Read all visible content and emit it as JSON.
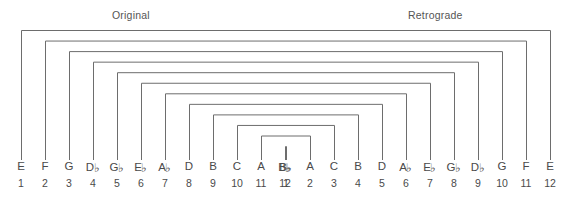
{
  "headers": {
    "original": "Original",
    "retrograde": "Retrograde"
  },
  "colors": {
    "line": "#6d6d6d",
    "text": "#4a4a4a",
    "title": "#555555",
    "background": "#ffffff"
  },
  "chart_data": {
    "type": "diagram",
    "diagram_kind": "nested-bracket-mapping",
    "left_row": {
      "label": "Original",
      "notes": [
        "E",
        "F",
        "G",
        "D♭",
        "G♭",
        "E♭",
        "A♭",
        "D",
        "B",
        "C",
        "A",
        "B♭"
      ],
      "numbers": [
        1,
        2,
        3,
        4,
        5,
        6,
        7,
        8,
        9,
        10,
        11,
        12
      ]
    },
    "right_row": {
      "label": "Retrograde",
      "notes": [
        "B♭",
        "A",
        "C",
        "B",
        "D",
        "A♭",
        "E♭",
        "G♭",
        "D♭",
        "G",
        "F",
        "E"
      ],
      "numbers": [
        1,
        2,
        3,
        4,
        5,
        6,
        7,
        8,
        9,
        10,
        11,
        12
      ]
    },
    "connections": [
      {
        "level": 1,
        "left_index": 1,
        "left_note": "E",
        "right_index": 12,
        "right_note": "E"
      },
      {
        "level": 2,
        "left_index": 2,
        "left_note": "F",
        "right_index": 11,
        "right_note": "F"
      },
      {
        "level": 3,
        "left_index": 3,
        "left_note": "G",
        "right_index": 10,
        "right_note": "G"
      },
      {
        "level": 4,
        "left_index": 4,
        "left_note": "D♭",
        "right_index": 9,
        "right_note": "D♭"
      },
      {
        "level": 5,
        "left_index": 5,
        "left_note": "G♭",
        "right_index": 8,
        "right_note": "G♭"
      },
      {
        "level": 6,
        "left_index": 6,
        "left_note": "E♭",
        "right_index": 7,
        "right_note": "E♭"
      },
      {
        "level": 7,
        "left_index": 7,
        "left_note": "A♭",
        "right_index": 6,
        "right_note": "A♭"
      },
      {
        "level": 8,
        "left_index": 8,
        "left_note": "D",
        "right_index": 5,
        "right_note": "D"
      },
      {
        "level": 9,
        "left_index": 9,
        "left_note": "B",
        "right_index": 4,
        "right_note": "B"
      },
      {
        "level": 10,
        "left_index": 10,
        "left_note": "C",
        "right_index": 3,
        "right_note": "C"
      },
      {
        "level": 11,
        "left_index": 11,
        "left_note": "A",
        "right_index": 2,
        "right_note": "A"
      },
      {
        "level": 12,
        "left_index": 12,
        "left_note": "B♭",
        "right_index": 1,
        "right_note": "B♭"
      }
    ]
  },
  "geometry": {
    "left_start_x": 21,
    "right_start_x": 286,
    "step_x": 24,
    "bracket_top_first": 30,
    "bracket_top_step": 10.55,
    "bracket_bottom": 160,
    "tick_top": 150,
    "tick_height": 10,
    "note_label_y": 160,
    "num_label_y": 177
  }
}
